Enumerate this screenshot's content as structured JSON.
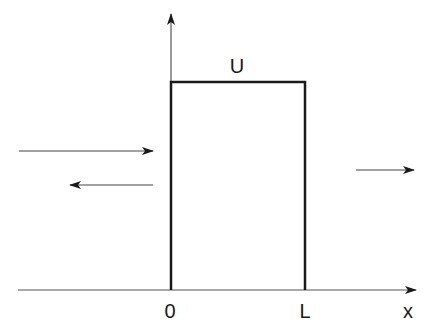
{
  "diagram": {
    "labels": {
      "barrier_height": "U",
      "left_edge": "0",
      "right_edge": "L",
      "axis": "x"
    },
    "arrows": [
      {
        "name": "incident-wave",
        "direction": "right",
        "region": "left"
      },
      {
        "name": "reflected-wave",
        "direction": "left",
        "region": "left"
      },
      {
        "name": "transmitted-wave",
        "direction": "right",
        "region": "right"
      }
    ],
    "colors": {
      "line": "#1a1a1a",
      "background": "#ffffff"
    }
  }
}
